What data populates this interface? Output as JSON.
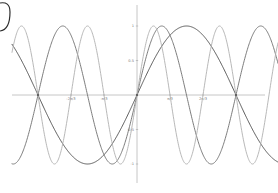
{
  "chart_data": {
    "type": "line",
    "title": "",
    "xlabel": "",
    "ylabel": "",
    "xlim": [
      -4.35,
      4.0
    ],
    "ylim": [
      -1.3,
      1.3
    ],
    "grid": false,
    "legend": null,
    "x_ticks": [
      {
        "value": -3.14159,
        "label": ""
      },
      {
        "value": -2.0944,
        "label": "-2π/3"
      },
      {
        "value": -1.0472,
        "label": "-π/3"
      },
      {
        "value": 1.0472,
        "label": "π/3"
      },
      {
        "value": 2.0944,
        "label": "2π/3"
      },
      {
        "value": 3.14159,
        "label": ""
      }
    ],
    "y_ticks": [
      {
        "value": 1,
        "label": "1"
      },
      {
        "value": 0.5,
        "label": "0.5"
      },
      {
        "value": -0.5,
        "label": "-0.5"
      },
      {
        "value": -1,
        "label": "-1"
      }
    ],
    "series": [
      {
        "name": "sin(x)",
        "frequency": 1,
        "amplitude": 1,
        "color": "#555555",
        "width": 1.0
      },
      {
        "name": "sin(2x)",
        "frequency": 2,
        "amplitude": 1,
        "color": "#6e6e6e",
        "width": 0.9
      },
      {
        "name": "sin(3x)",
        "frequency": 3,
        "amplitude": 1,
        "color": "#b0b0b0",
        "width": 0.9
      }
    ],
    "marked_points": [
      {
        "x": -3.14159,
        "y": 0
      },
      {
        "x": 0,
        "y": 0
      },
      {
        "x": 3.14159,
        "y": 0
      }
    ]
  },
  "layout": {
    "origin_px": [
      137,
      95
    ],
    "px_per_pi": 99,
    "px_per_unit_y": 69,
    "x_axis_px": [
      12,
      265
    ],
    "y_axis_px": [
      5,
      183
    ]
  },
  "annotation": {
    "shape": "partial-circle-stroke",
    "color": "#333333"
  }
}
